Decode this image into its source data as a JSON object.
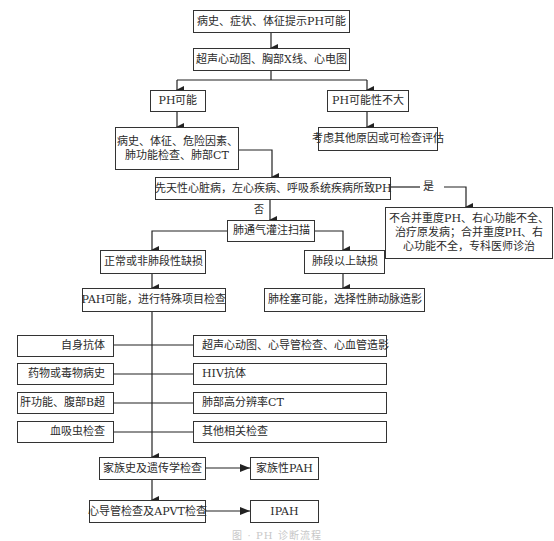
{
  "diagram": {
    "type": "flowchart",
    "nodes": {
      "start": "病史、症状、体征提示PH可能",
      "screening": "超声心动图、胸部X线、心电图",
      "ph_possible": "PH可能",
      "ph_unlikely": "PH可能性不大",
      "workup": [
        "病史、体征、危险因素、",
        "肺功能检查、肺部CT"
      ],
      "other_causes": "考虑其他原因或可检查评估",
      "secondary_ph": "先天性心脏病，左心疾病、呼吸系统疾病所致PH",
      "secondary_treatment": [
        "不合并重度PH、右心功能不全、",
        "治疗原发病；合并重度PH、右",
        "心功能不全，专科医师诊治"
      ],
      "vq_scan": "肺通气灌注扫描",
      "normal_defect": "正常或非肺段性缺损",
      "segmental_defect": "肺段以上缺损",
      "pah_possible": "PAH可能，进行特殊项目检查",
      "pe_possible": "肺栓塞可能，选择性肺动脉造影",
      "left_tests": [
        "自身抗体",
        "药物或毒物病史",
        "肝功能、腹部B超",
        "血吸虫检查"
      ],
      "right_tests": [
        "超声心动图、心导管检查、心血管造影",
        "HIV抗体",
        "肺部高分辨率CT",
        "其他相关检查"
      ],
      "family_history": "家族史及遗传学检查",
      "familial_pah": "家族性PAH",
      "cath_apvt": "心导管检查及APVT检查",
      "ipah": "IPAH"
    },
    "edge_labels": {
      "yes": "是",
      "no": "否"
    },
    "caption": "图 · PH 诊断流程"
  }
}
